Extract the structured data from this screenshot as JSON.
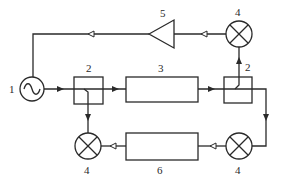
{
  "diagram": {
    "type": "block-diagram",
    "components": [
      {
        "id": "oscillator",
        "label": "1",
        "shape": "circle-sine"
      },
      {
        "id": "coupler-left",
        "label": "2",
        "shape": "box"
      },
      {
        "id": "device-under-test",
        "label": "3",
        "shape": "rectangle"
      },
      {
        "id": "coupler-right",
        "label": "2",
        "shape": "box"
      },
      {
        "id": "mixer-top",
        "label": "4",
        "shape": "circle-x"
      },
      {
        "id": "amplifier",
        "label": "5",
        "shape": "triangle"
      },
      {
        "id": "mixer-bottom-right",
        "label": "4",
        "shape": "circle-x"
      },
      {
        "id": "filter-block",
        "label": "6",
        "shape": "rectangle"
      },
      {
        "id": "mixer-bottom-left",
        "label": "4",
        "shape": "circle-x"
      }
    ],
    "labels": {
      "oscillator": "1",
      "coupler_left": "2",
      "block_3": "3",
      "coupler_right": "2",
      "mixer_top": "4",
      "amplifier": "5",
      "mixer_bottom_right": "4",
      "block_6": "6",
      "mixer_bottom_left": "4"
    },
    "connections": [
      {
        "from": "oscillator",
        "to": "coupler-left",
        "arrow": "filled"
      },
      {
        "from": "coupler-left",
        "to": "device-under-test",
        "arrow": "filled"
      },
      {
        "from": "device-under-test",
        "to": "coupler-right",
        "arrow": "filled"
      },
      {
        "from": "coupler-right",
        "to": "mixer-top",
        "arrow": "filled"
      },
      {
        "from": "mixer-top",
        "to": "amplifier",
        "arrow": "open"
      },
      {
        "from": "amplifier",
        "to": "oscillator",
        "arrow": "open"
      },
      {
        "from": "coupler-right",
        "to": "mixer-bottom-right",
        "arrow": "filled"
      },
      {
        "from": "mixer-bottom-right",
        "to": "filter-block",
        "arrow": "open"
      },
      {
        "from": "filter-block",
        "to": "mixer-bottom-left",
        "arrow": "open"
      },
      {
        "from": "coupler-left",
        "to": "mixer-bottom-left",
        "arrow": "filled"
      }
    ]
  }
}
